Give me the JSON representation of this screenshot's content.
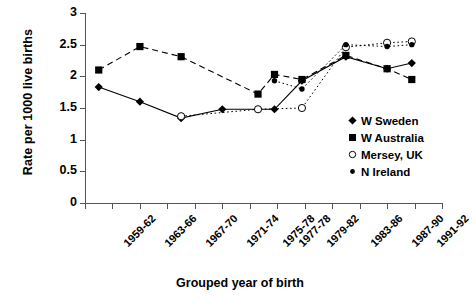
{
  "chart_data": {
    "type": "line",
    "title": "",
    "xlabel": "Grouped year of birth",
    "ylabel": "Rate per 1000 live births",
    "ylim": [
      0,
      3
    ],
    "yticks": [
      0,
      0.5,
      1,
      1.5,
      2,
      2.5,
      3
    ],
    "ytick_labels": [
      "0",
      "0.5",
      "1",
      "1.5",
      "2",
      "2.5",
      "3"
    ],
    "grid": false,
    "legend_position": "right-inside",
    "categories": [
      "1959-62",
      "1963-66",
      "1967-70",
      "1971-74",
      "1975-78",
      "1977-78",
      "1979-82",
      "1983-86",
      "1987-90",
      "1991-92"
    ],
    "x_positions": [
      0.5,
      2.0,
      3.5,
      5.0,
      6.3,
      6.9,
      7.9,
      9.5,
      11.0,
      11.9
    ],
    "x_axis_range": [
      0,
      13
    ],
    "series": [
      {
        "name": "W Sweden",
        "marker": "filled-diamond",
        "line_style": "solid",
        "color": "#000000",
        "values": [
          1.83,
          1.6,
          1.34,
          1.48,
          null,
          1.48,
          1.93,
          2.31,
          2.12,
          2.21
        ]
      },
      {
        "name": "W Australia",
        "marker": "filled-square",
        "line_style": "dashed",
        "color": "#000000",
        "values": [
          2.1,
          2.47,
          2.31,
          null,
          1.72,
          2.03,
          1.95,
          2.33,
          2.12,
          1.95
        ]
      },
      {
        "name": "Mersey, UK",
        "marker": "open-circle",
        "line_style": "dotted",
        "color": "#000000",
        "values": [
          null,
          null,
          1.37,
          null,
          1.48,
          null,
          1.5,
          2.46,
          2.53,
          2.55
        ]
      },
      {
        "name": "N Ireland",
        "marker": "filled-dot",
        "line_style": "dotted",
        "color": "#000000",
        "values": [
          null,
          null,
          null,
          null,
          null,
          1.93,
          1.8,
          2.5,
          2.47,
          2.5
        ]
      }
    ]
  },
  "legend": {
    "items": [
      {
        "label": "W Sweden",
        "marker": "filled-diamond"
      },
      {
        "label": "W Australia",
        "marker": "filled-square"
      },
      {
        "label": "Mersey, UK",
        "marker": "open-circle"
      },
      {
        "label": "N Ireland",
        "marker": "filled-dot"
      }
    ]
  }
}
